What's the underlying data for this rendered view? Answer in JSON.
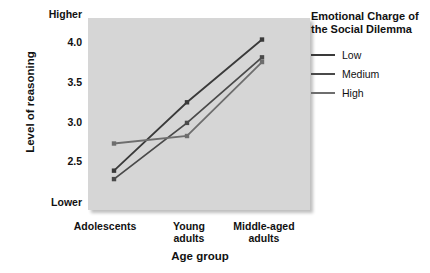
{
  "chart_data": {
    "type": "line",
    "title": "",
    "xlabel": "Age group",
    "ylabel": "Level of reasoning",
    "categories": [
      "Adolescents",
      "Young adults",
      "Middle-aged adults"
    ],
    "category_lines": [
      [
        "Adolescents"
      ],
      [
        "Young",
        "adults"
      ],
      [
        "Middle-aged",
        "adults"
      ]
    ],
    "ylim": [
      2.25,
      4.3
    ],
    "yticks": [
      2.5,
      3.0,
      3.5,
      4.0
    ],
    "ytick_labels": [
      "2.5",
      "3.0",
      "3.5",
      "4.0"
    ],
    "y_axis_low_label": "Lower",
    "y_axis_high_label": "Higher",
    "grid": false,
    "legend_position": "right",
    "legend_title_lines": [
      "Emotional Charge of",
      "the Social Dilemma"
    ],
    "legend_title": "Emotional Charge of the Social Dilemma",
    "plot_background": "#d6d6d6",
    "series": [
      {
        "name": "Low",
        "color": "#3a3a3a",
        "values": [
          2.67,
          3.4,
          4.07
        ]
      },
      {
        "name": "Medium",
        "color": "#4a4a4a",
        "values": [
          2.58,
          3.18,
          3.88
        ]
      },
      {
        "name": "High",
        "color": "#6e6e6e",
        "values": [
          2.96,
          3.04,
          3.83
        ]
      }
    ]
  },
  "axes": {
    "y_title": "Level of reasoning",
    "x_title": "Age group",
    "y_high": "Higher",
    "y_low": "Lower",
    "ytick_0": "4.0",
    "ytick_1": "3.5",
    "ytick_2": "3.0",
    "ytick_3": "2.5",
    "xtick_0": "Adolescents",
    "xtick_1_line1": "Young",
    "xtick_1_line2": "adults",
    "xtick_2_line1": "Middle-aged",
    "xtick_2_line2": "adults"
  },
  "legend": {
    "title_line1": "Emotional Charge of",
    "title_line2": "the Social Dilemma",
    "items": [
      {
        "label": "Low",
        "color": "#3a3a3a"
      },
      {
        "label": "Medium",
        "color": "#4a4a4a"
      },
      {
        "label": "High",
        "color": "#6e6e6e"
      }
    ]
  }
}
